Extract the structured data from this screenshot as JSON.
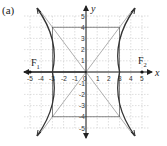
{
  "panel_label": "(a)",
  "axes": {
    "x_label": "x",
    "y_label": "y",
    "x_ticks": [
      "-5",
      "-4",
      "-3",
      "-2",
      "-1",
      "0",
      "1",
      "2",
      "3",
      "4",
      "5"
    ],
    "y_ticks": [
      "5",
      "4",
      "3",
      "2",
      "1",
      "-1",
      "-2",
      "-3",
      "-4",
      "-5"
    ],
    "x_range": [
      -5,
      5
    ],
    "y_range": [
      -5,
      5
    ],
    "grid": true
  },
  "foci": [
    {
      "label": "F",
      "sub": "1",
      "x": -5,
      "y": 0
    },
    {
      "label": "F",
      "sub": "2",
      "x": 5,
      "y": 0
    }
  ],
  "hyperbola": {
    "a": 3,
    "b": 4,
    "orientation": "horizontal"
  },
  "asymptotes": [
    "y = 4x/3",
    "y = -4x/3"
  ],
  "rectangle": {
    "x": [
      -3,
      3
    ],
    "y": [
      -4,
      4
    ]
  },
  "colors": {
    "curve": "#333333",
    "asymptote": "#9a9a9a",
    "grid": "#c8c8c8",
    "axis": "#111111"
  }
}
